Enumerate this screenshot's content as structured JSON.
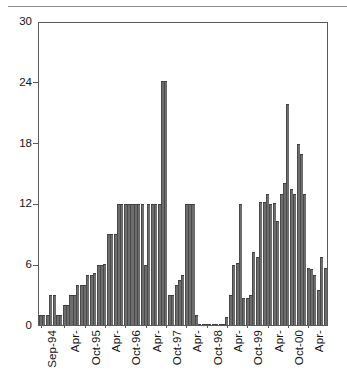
{
  "figure": {
    "name": "monthly-bar-chart",
    "background_color": "#ffffff",
    "bar_color": "#6d6d6d",
    "axis_color": "#5a5a5a",
    "text_color": "#151515",
    "divider_label": "page-divider-rule"
  },
  "chart_data": {
    "type": "bar",
    "title": "",
    "subtitle": "",
    "xlabel": "",
    "ylabel": "",
    "ylim": [
      0,
      30
    ],
    "yticks": [
      0,
      6,
      12,
      18,
      24,
      30
    ],
    "ytick_labels": [
      "0",
      "6",
      "12",
      "18",
      "24",
      "30"
    ],
    "grid": false,
    "legend": null,
    "legend_position": "none",
    "xtick_labels": [
      "Sep-94",
      "Apr-",
      "Oct-95",
      "Apr-",
      "Oct-96",
      "Apr-",
      "Oct-97",
      "Apr-",
      "Oct-98",
      "Apr-",
      "Oct-99",
      "Apr-",
      "Oct-00",
      "Apr-"
    ],
    "xtick_positions": [
      0,
      7,
      13,
      19,
      25,
      31,
      37,
      43,
      49,
      55,
      61,
      67,
      73,
      79
    ],
    "categories": [
      "Sep-94",
      "Oct-94",
      "Nov-94",
      "Dec-94",
      "Jan-95",
      "Feb-95",
      "Mar-95",
      "Apr-95",
      "May-95",
      "Jun-95",
      "Jul-95",
      "Aug-95",
      "Sep-95",
      "Oct-95",
      "Nov-95",
      "Dec-95",
      "Jan-96",
      "Feb-96",
      "Mar-96",
      "Apr-96",
      "May-96",
      "Jun-96",
      "Jul-96",
      "Aug-96",
      "Sep-96",
      "Oct-96",
      "Nov-96",
      "Dec-96",
      "Jan-97",
      "Feb-97",
      "Mar-97",
      "Apr-97",
      "May-97",
      "Jun-97",
      "Jul-97",
      "Aug-97",
      "Sep-97",
      "Oct-97",
      "Nov-97",
      "Dec-97",
      "Jan-98",
      "Feb-98",
      "Mar-98",
      "Apr-98",
      "May-98",
      "Jun-98",
      "Jul-98",
      "Aug-98",
      "Sep-98",
      "Oct-98",
      "Nov-98",
      "Dec-98",
      "Jan-99",
      "Feb-99",
      "Mar-99",
      "Apr-99",
      "May-99",
      "Jun-99",
      "Jul-99",
      "Aug-99",
      "Sep-99",
      "Oct-99",
      "Nov-99",
      "Dec-99",
      "Jan-00",
      "Feb-00",
      "Mar-00",
      "Apr-00",
      "May-00",
      "Jun-00",
      "Jul-00",
      "Aug-00",
      "Sep-00",
      "Oct-00",
      "Nov-00",
      "Dec-00",
      "Jan-01",
      "Feb-01",
      "Mar-01",
      "Apr-01",
      "May-01",
      "Jun-01",
      "Jul-01",
      "Aug-01",
      "Sep-01"
    ],
    "values": [
      1.0,
      1.0,
      1.0,
      3.0,
      3.0,
      1.0,
      1.0,
      2.0,
      2.0,
      3.0,
      3.0,
      4.0,
      4.0,
      4.0,
      5.0,
      5.0,
      5.2,
      6.0,
      6.0,
      6.1,
      9.0,
      9.0,
      9.0,
      12.0,
      12.0,
      12.0,
      12.0,
      12.0,
      12.0,
      12.0,
      12.0,
      6.0,
      12.0,
      12.0,
      12.0,
      12.0,
      24.2,
      24.2,
      3.0,
      3.0,
      4.0,
      4.5,
      5.0,
      12.0,
      12.0,
      12.0,
      1.0,
      0.1,
      0.1,
      0.1,
      0.1,
      0.1,
      0.1,
      0.1,
      0.1,
      0.8,
      3.0,
      6.0,
      6.2,
      12.0,
      2.7,
      2.7,
      3.0,
      7.3,
      6.8,
      12.2,
      12.2,
      13.0,
      12.0,
      12.1,
      10.3,
      13.0,
      14.1,
      22.0,
      13.5,
      13.0,
      18.0,
      17.0,
      13.0,
      5.7,
      5.6,
      5.0,
      3.5,
      6.8,
      5.7
    ],
    "peak_annotations": [
      {
        "category": "Oct-97",
        "value": 24.2
      },
      {
        "category": "Oct-00",
        "value": 22.0
      },
      {
        "category": "Jan-01",
        "value": 18.0
      }
    ]
  }
}
